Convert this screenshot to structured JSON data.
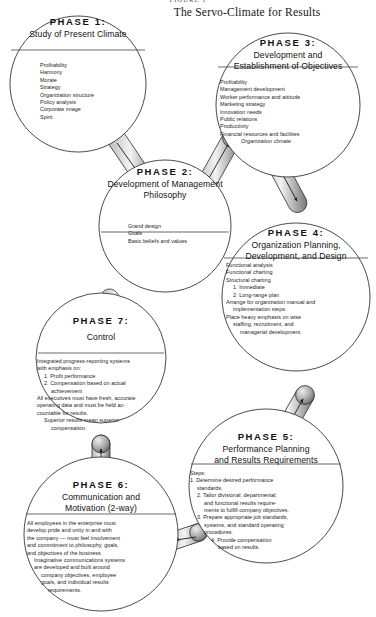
{
  "figure": {
    "number": "FIGURE 1",
    "title_part1": "T",
    "title": "The Servo-Climate for Results"
  },
  "nodes": [
    {
      "id": "phase1",
      "phase": "PHASE 1:",
      "title": "Study of Present Climate",
      "body": [
        "Profitability",
        "Harmony",
        "Morale",
        "Strategy",
        "Organization structure",
        "Policy analysis",
        "Corporate image",
        "Spirit"
      ]
    },
    {
      "id": "phase3",
      "phase": "PHASE 3:",
      "title": "Development and\nEstablishment of Objectives",
      "title_lines": [
        "Development and",
        "Establishment of Objectives"
      ],
      "body": [
        "Profitability",
        "Management development",
        "Worker performance and attitude",
        "Marketing strategy",
        "Innovation needs",
        "Public relations",
        "Productivity",
        "Financial resources and facilities",
        "Organization climate"
      ]
    },
    {
      "id": "phase2",
      "phase": "PHASE 2:",
      "title_lines": [
        "Development of Management",
        "Philosophy"
      ],
      "body": [
        "Grand design",
        "Goals",
        "Basic beliefs and values"
      ]
    },
    {
      "id": "phase4",
      "phase": "PHASE 4:",
      "title_lines": [
        "Organization Planning,",
        "Development,   and Design"
      ],
      "body": [
        "Functional analysis",
        "Functional charting",
        "Structural charting",
        "1. Immediate",
        "2. Long-range plan",
        "Arrange for organization manual and",
        "implementation steps.",
        "Place heavy emphasis on wise",
        "staffing, recruitment, and",
        "managerial development."
      ]
    },
    {
      "id": "phase5",
      "phase": "PHASE 5:",
      "title_lines": [
        "Performance Planning",
        "and Results Requirements"
      ],
      "body": [
        "Steps:",
        "1. Determine desired performance",
        "standards.",
        "2. Tailor divisional, departmental,",
        "and functional results require-",
        "ments to fulfill company objectives.",
        "3. Prepare appropriate job standards,",
        "systems, and standard operating",
        "procedures.",
        "4. Provide compensation",
        "based on results."
      ]
    },
    {
      "id": "phase6",
      "phase": "PHASE 6:",
      "title_lines": [
        "Communication and",
        "Motivation (2-way)"
      ],
      "body": [
        "All employees in the enterprise must",
        "develop pride and unity in and with",
        "the company — must feel involvement",
        "and commitment to philosophy, goals,",
        "and objectives of the business.",
        "Imaginative communications systems",
        "are developed and built around",
        "company objectives, employee",
        "goals, and individual results",
        "requirements."
      ]
    },
    {
      "id": "phase7",
      "phase": "PHASE 7:",
      "title_lines": [
        "Control"
      ],
      "body": [
        "Integrated progress-reporting systems",
        "with emphasis on:",
        "1. Profit performance",
        "2. Compensation based on actual",
        "achievement",
        "All executives must have fresh, accurate",
        "operating data and must be held ac-",
        "countable for results.",
        "Superior results mean superior",
        "compensation."
      ]
    }
  ],
  "connectors": [
    {
      "name": "phase1-to-phase2",
      "from": "phase1",
      "to": "phase2"
    },
    {
      "name": "phase2-to-phase3",
      "from": "phase2",
      "to": "phase3"
    },
    {
      "name": "phase3-to-phase4",
      "from": "phase3",
      "to": "phase4"
    },
    {
      "name": "phase4-to-phase5",
      "from": "phase4",
      "to": "phase5"
    },
    {
      "name": "phase5-to-phase6",
      "from": "phase5",
      "to": "phase6"
    },
    {
      "name": "phase6-to-phase7",
      "from": "phase6",
      "to": "phase7"
    },
    {
      "name": "phase7-to-phase2",
      "from": "phase7",
      "to": "phase2"
    }
  ],
  "colors": {
    "ink": "#1b1b1b",
    "stroke": "#2a2a2a",
    "shade": "#8e8e8e",
    "paper": "#ffffff"
  }
}
